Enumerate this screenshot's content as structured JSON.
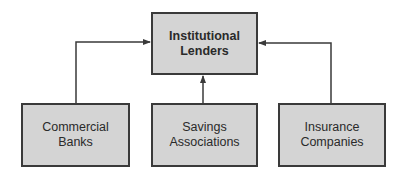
{
  "diagram": {
    "top_node": {
      "id": "institutional-lenders",
      "lines": [
        "Institutional",
        "Lenders"
      ]
    },
    "bottom_nodes": [
      {
        "id": "commercial-banks",
        "lines": [
          "Commercial",
          "Banks"
        ]
      },
      {
        "id": "savings-associations",
        "lines": [
          "Savings",
          "Associations"
        ]
      },
      {
        "id": "insurance-companies",
        "lines": [
          "Insurance",
          "Companies"
        ]
      }
    ],
    "edges": [
      {
        "from": "commercial-banks",
        "to": "institutional-lenders",
        "direction": "arrow-to-top-left-side"
      },
      {
        "from": "savings-associations",
        "to": "institutional-lenders",
        "direction": "arrow-to-top-bottom"
      },
      {
        "from": "insurance-companies",
        "to": "institutional-lenders",
        "direction": "arrow-to-top-right-side"
      }
    ],
    "colors": {
      "box_fill": "#d4d4d4",
      "box_border": "#3a3a3a",
      "line": "#3a3a3a",
      "text": "#2a2a2a"
    }
  }
}
